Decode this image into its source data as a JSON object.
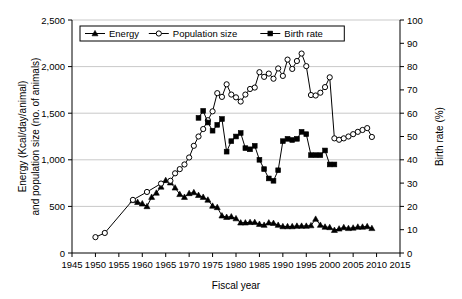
{
  "chart_data": {
    "type": "line",
    "title": "",
    "xlabel": "Fiscal year",
    "ylabel": "Energy (Kcal/day/animal) and population size (no. of animals)",
    "y2label": "Birth rate (%)",
    "xlim": [
      1945,
      2015
    ],
    "ylim": [
      0,
      2500
    ],
    "y2lim": [
      0,
      100
    ],
    "xticks": [
      1945,
      1950,
      1955,
      1960,
      1965,
      1970,
      1975,
      1980,
      1985,
      1990,
      1995,
      2000,
      2005,
      2010,
      2015
    ],
    "xtick_labels": [
      "1945",
      "1950",
      "1955",
      "1960",
      "1965",
      "1970",
      "1975",
      "1980",
      "1985",
      "1990",
      "1995",
      "2000",
      "2005",
      "2010",
      "2015"
    ],
    "yticks": [
      0,
      500,
      1000,
      1500,
      2000,
      2500
    ],
    "ytick_labels": [
      "0",
      "500",
      "1,000",
      "1,500",
      "2,000",
      "2,500"
    ],
    "y2ticks": [
      0,
      10,
      20,
      30,
      40,
      50,
      60,
      70,
      80,
      90,
      100
    ],
    "y2tick_labels": [
      "0",
      "10",
      "20",
      "30",
      "40",
      "50",
      "60",
      "70",
      "80",
      "90",
      "100"
    ],
    "grid": true,
    "grid_axis": "y",
    "legend_position": "top-left-inside",
    "series": [
      {
        "name": "Energy",
        "axis": "left",
        "marker": "filled-triangle",
        "x": [
          1958,
          1959,
          1960,
          1961,
          1962,
          1963,
          1964,
          1965,
          1966,
          1967,
          1968,
          1969,
          1970,
          1971,
          1972,
          1973,
          1974,
          1975,
          1976,
          1977,
          1978,
          1979,
          1980,
          1981,
          1982,
          1983,
          1984,
          1985,
          1986,
          1987,
          1988,
          1989,
          1990,
          1991,
          1992,
          1993,
          1994,
          1995,
          1996,
          1997,
          1998,
          1999,
          2000,
          2001,
          2002,
          2003,
          2004,
          2005,
          2006,
          2007,
          2008,
          2009
        ],
        "values": [
          565,
          545,
          530,
          500,
          600,
          645,
          710,
          780,
          755,
          700,
          630,
          600,
          640,
          650,
          620,
          600,
          570,
          505,
          490,
          400,
          385,
          390,
          370,
          325,
          325,
          330,
          330,
          310,
          300,
          325,
          320,
          300,
          285,
          285,
          285,
          290,
          290,
          290,
          295,
          365,
          300,
          280,
          275,
          245,
          260,
          275,
          265,
          270,
          280,
          280,
          285,
          265
        ]
      },
      {
        "name": "Population size",
        "axis": "left",
        "marker": "open-circle",
        "x": [
          1950,
          1952,
          1958,
          1961,
          1964,
          1966,
          1967,
          1968,
          1969,
          1970,
          1971,
          1972,
          1973,
          1974,
          1975,
          1976,
          1977,
          1978,
          1979,
          1980,
          1981,
          1982,
          1983,
          1984,
          1985,
          1986,
          1987,
          1988,
          1989,
          1990,
          1991,
          1992,
          1993,
          1994,
          1995,
          1996,
          1997,
          1998,
          1999,
          2000,
          2001,
          2002,
          2003,
          2004,
          2005,
          2006,
          2007,
          2008,
          2009
        ],
        "values": [
          170,
          215,
          570,
          655,
          745,
          775,
          855,
          900,
          950,
          1025,
          1150,
          1250,
          1330,
          1425,
          1520,
          1715,
          1675,
          1810,
          1700,
          1670,
          1625,
          1700,
          1760,
          1775,
          1940,
          1890,
          1925,
          1870,
          1980,
          1900,
          2075,
          1975,
          2060,
          2140,
          2005,
          1695,
          1690,
          1720,
          1780,
          1885,
          1230,
          1215,
          1230,
          1250,
          1275,
          1300,
          1320,
          1340,
          1245
        ]
      },
      {
        "name": "Birth rate",
        "axis": "right",
        "marker": "filled-square",
        "x": [
          1972,
          1973,
          1974,
          1975,
          1976,
          1977,
          1978,
          1979,
          1980,
          1981,
          1982,
          1983,
          1984,
          1985,
          1986,
          1987,
          1988,
          1989,
          1990,
          1991,
          1992,
          1993,
          1994,
          1995,
          1996,
          1997,
          1998,
          1999,
          2000,
          2001,
          2002,
          2003,
          2004,
          2005,
          2006,
          2007,
          2008
        ],
        "values": [
          58,
          61,
          56,
          52.5,
          55,
          57.5,
          43.5,
          48,
          50,
          51.5,
          45,
          44.5,
          46,
          40,
          36,
          32,
          31,
          35.5,
          48,
          49,
          48.5,
          49,
          52,
          51,
          42,
          42,
          42,
          44,
          38,
          38,
          null,
          null,
          null,
          null,
          null,
          null,
          null
        ]
      }
    ]
  },
  "legend": {
    "items": [
      {
        "label": "Energy",
        "marker": "filled-triangle"
      },
      {
        "label": "Population size",
        "marker": "open-circle"
      },
      {
        "label": "Birth rate",
        "marker": "filled-square"
      }
    ]
  }
}
